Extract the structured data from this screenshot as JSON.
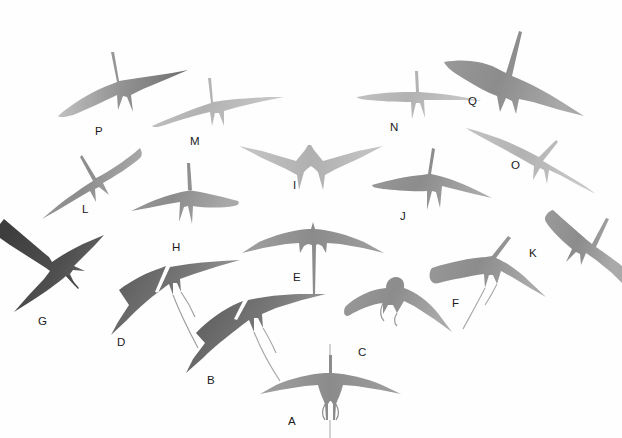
{
  "plate": {
    "title": "Frigatebird flight silhouettes",
    "background_color": "#ffffff",
    "width": 622,
    "height": 438,
    "ink_colors": {
      "light": "#b9b9b9",
      "mid": "#8f8f8f",
      "dark": "#6f6f6f",
      "darkest": "#4a4a4a",
      "label": "#1a1a1a"
    },
    "label_count": 17
  },
  "labels": [
    {
      "id": "A",
      "text": "A",
      "x": 288,
      "y": 416,
      "shade": "mid",
      "note": "ventral symmetric silhouette, straight wings, forked tail, neck raised"
    },
    {
      "id": "B",
      "text": "B",
      "x": 207,
      "y": 375,
      "shade": "dark",
      "note": "banking left, angular crooked wings, long streaming tail"
    },
    {
      "id": "C",
      "text": "C",
      "x": 358,
      "y": 347,
      "shade": "mid",
      "note": "short rounded wings, inflated gular pouch bump, short legs"
    },
    {
      "id": "D",
      "text": "D",
      "x": 117,
      "y": 337,
      "shade": "dark",
      "note": "swept-back wings, head up-left, long trailing tail streamer"
    },
    {
      "id": "E",
      "text": "E",
      "x": 293,
      "y": 272,
      "shade": "mid",
      "note": "symmetric ventral, drooped wrists, very long thin tail"
    },
    {
      "id": "F",
      "text": "F",
      "x": 452,
      "y": 298,
      "shade": "mid",
      "note": "banking right, head up, tail streamer trailing down-left"
    },
    {
      "id": "G",
      "text": "G",
      "x": 38,
      "y": 316,
      "shade": "darkest",
      "note": "darkest bird, long pointed bill, deeply forked tail"
    },
    {
      "id": "H",
      "text": "H",
      "x": 172,
      "y": 242,
      "shade": "mid",
      "note": "gliding left, long slender wings, head raised"
    },
    {
      "id": "I",
      "text": "I",
      "x": 293,
      "y": 180,
      "shade": "light",
      "note": "symmetric ventral, angled wings, short head"
    },
    {
      "id": "J",
      "text": "J",
      "x": 400,
      "y": 211,
      "shade": "mid",
      "note": "gliding right, raised head, forked tail"
    },
    {
      "id": "K",
      "text": "K",
      "x": 529,
      "y": 248,
      "shade": "mid",
      "note": "steep bank, narrow swept wings, thin tail"
    },
    {
      "id": "L",
      "text": "L",
      "x": 82,
      "y": 204,
      "shade": "mid",
      "note": "gliding down-left, long crossed wings"
    },
    {
      "id": "M",
      "text": "M",
      "x": 190,
      "y": 136,
      "shade": "light",
      "note": "gliding right, slender straight wings, raised neck"
    },
    {
      "id": "N",
      "text": "N",
      "x": 390,
      "y": 122,
      "shade": "light",
      "note": "gliding right, shallow wings, raised neck"
    },
    {
      "id": "O",
      "text": "O",
      "x": 511,
      "y": 160,
      "shade": "light",
      "note": "long shallow glide, narrow wings"
    },
    {
      "id": "P",
      "text": "P",
      "x": 95,
      "y": 126,
      "shade": "mid",
      "note": "gliding right, upswept wings, raised neck"
    },
    {
      "id": "Q",
      "text": "Q",
      "x": 468,
      "y": 96,
      "shade": "mid",
      "note": "top bird, raised neck, swept wings, forked tail"
    }
  ]
}
